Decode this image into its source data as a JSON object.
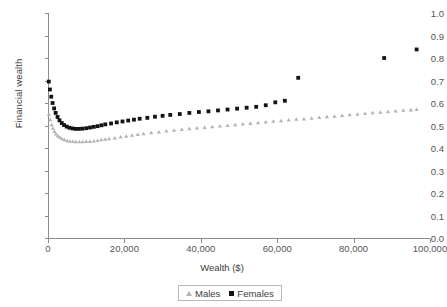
{
  "chart_data": {
    "type": "scatter",
    "title": "",
    "xlabel": "Wealth ($)",
    "ylabel": "Financial wealth",
    "xlim": [
      0,
      100000
    ],
    "ylim": [
      0,
      1.0
    ],
    "xticks": [
      "0",
      "20,000",
      "40,000",
      "60,000",
      "80,000",
      "100,000"
    ],
    "xtick_values": [
      0,
      20000,
      40000,
      60000,
      80000,
      100000
    ],
    "yticks": [
      "0.0",
      "0.1",
      "0.2",
      "0.3",
      "0.4",
      "0.5",
      "0.6",
      "0.7",
      "0.8",
      "0.9",
      "1.0"
    ],
    "ytick_values": [
      0.0,
      0.1,
      0.2,
      0.3,
      0.4,
      0.5,
      0.6,
      0.7,
      0.8,
      0.9,
      1.0
    ],
    "grid": false,
    "legend_position": "bottom-center",
    "series": [
      {
        "name": "Males",
        "marker": "triangle",
        "color": "#b4b4b4",
        "points": [
          [
            250,
            0.548
          ],
          [
            600,
            0.525
          ],
          [
            950,
            0.503
          ],
          [
            1300,
            0.487
          ],
          [
            1700,
            0.473
          ],
          [
            2100,
            0.462
          ],
          [
            2600,
            0.453
          ],
          [
            3100,
            0.447
          ],
          [
            3700,
            0.441
          ],
          [
            4300,
            0.436
          ],
          [
            5000,
            0.432
          ],
          [
            5700,
            0.43
          ],
          [
            6500,
            0.428
          ],
          [
            7300,
            0.427
          ],
          [
            8200,
            0.427
          ],
          [
            9100,
            0.427
          ],
          [
            10000,
            0.428
          ],
          [
            11000,
            0.429
          ],
          [
            12000,
            0.431
          ],
          [
            13000,
            0.433
          ],
          [
            14000,
            0.436
          ],
          [
            15000,
            0.438
          ],
          [
            16000,
            0.441
          ],
          [
            17500,
            0.444
          ],
          [
            19000,
            0.448
          ],
          [
            20500,
            0.452
          ],
          [
            22000,
            0.456
          ],
          [
            23500,
            0.46
          ],
          [
            25000,
            0.463
          ],
          [
            27000,
            0.467
          ],
          [
            29000,
            0.471
          ],
          [
            31000,
            0.475
          ],
          [
            33000,
            0.478
          ],
          [
            35000,
            0.482
          ],
          [
            37000,
            0.485
          ],
          [
            39000,
            0.488
          ],
          [
            41000,
            0.491
          ],
          [
            43000,
            0.494
          ],
          [
            45000,
            0.497
          ],
          [
            47000,
            0.5
          ],
          [
            49000,
            0.503
          ],
          [
            51000,
            0.506
          ],
          [
            53000,
            0.509
          ],
          [
            55000,
            0.512
          ],
          [
            57000,
            0.515
          ],
          [
            59000,
            0.518
          ],
          [
            61000,
            0.521
          ],
          [
            63000,
            0.524
          ],
          [
            65000,
            0.527
          ],
          [
            67000,
            0.529
          ],
          [
            69000,
            0.532
          ],
          [
            71000,
            0.535
          ],
          [
            73000,
            0.538
          ],
          [
            75000,
            0.541
          ],
          [
            77000,
            0.544
          ],
          [
            79000,
            0.547
          ],
          [
            81000,
            0.55
          ],
          [
            83000,
            0.553
          ],
          [
            85000,
            0.556
          ],
          [
            87000,
            0.558
          ],
          [
            89000,
            0.561
          ],
          [
            91000,
            0.564
          ],
          [
            93000,
            0.567
          ],
          [
            95000,
            0.569
          ],
          [
            96500,
            0.571
          ]
        ]
      },
      {
        "name": "Females",
        "marker": "square",
        "color": "#141414",
        "points": [
          [
            200,
            0.695
          ],
          [
            500,
            0.66
          ],
          [
            850,
            0.628
          ],
          [
            1200,
            0.6
          ],
          [
            1600,
            0.576
          ],
          [
            2000,
            0.556
          ],
          [
            2500,
            0.538
          ],
          [
            3000,
            0.523
          ],
          [
            3600,
            0.511
          ],
          [
            4200,
            0.502
          ],
          [
            4900,
            0.495
          ],
          [
            5600,
            0.49
          ],
          [
            6400,
            0.487
          ],
          [
            7200,
            0.485
          ],
          [
            8100,
            0.485
          ],
          [
            9000,
            0.486
          ],
          [
            10000,
            0.488
          ],
          [
            11000,
            0.491
          ],
          [
            12000,
            0.494
          ],
          [
            13000,
            0.497
          ],
          [
            14000,
            0.501
          ],
          [
            15000,
            0.505
          ],
          [
            16500,
            0.509
          ],
          [
            18000,
            0.514
          ],
          [
            19500,
            0.518
          ],
          [
            21000,
            0.522
          ],
          [
            22500,
            0.526
          ],
          [
            24000,
            0.53
          ],
          [
            26000,
            0.534
          ],
          [
            28000,
            0.539
          ],
          [
            30000,
            0.543
          ],
          [
            32000,
            0.547
          ],
          [
            34500,
            0.551
          ],
          [
            37000,
            0.556
          ],
          [
            39500,
            0.56
          ],
          [
            42000,
            0.563
          ],
          [
            44500,
            0.567
          ],
          [
            47000,
            0.571
          ],
          [
            49500,
            0.575
          ],
          [
            52000,
            0.579
          ],
          [
            54500,
            0.583
          ],
          [
            57000,
            0.59
          ],
          [
            59500,
            0.603
          ],
          [
            62000,
            0.61
          ],
          [
            65500,
            0.712
          ],
          [
            88000,
            0.8
          ],
          [
            96500,
            0.838
          ]
        ]
      }
    ]
  },
  "legend": {
    "entries": [
      {
        "label": "Males"
      },
      {
        "label": "Females"
      }
    ]
  },
  "axis": {
    "line_color": "#8c8c8c"
  }
}
